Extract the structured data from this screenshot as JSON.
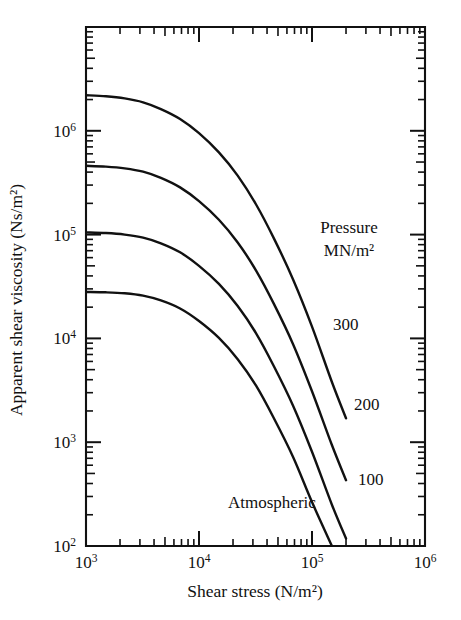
{
  "chart_data": {
    "type": "line",
    "title": "",
    "xlabel": "Shear stress (N/m²)",
    "ylabel": "Apparent shear viscosity (Ns/m²)",
    "xscale": "log",
    "yscale": "log",
    "xlim": [
      1000,
      1000000
    ],
    "ylim": [
      100,
      10000000
    ],
    "x_tick_labels": [
      "10³",
      "10⁴",
      "10⁵",
      "10⁶"
    ],
    "x_tick_values": [
      1000,
      10000,
      100000,
      1000000
    ],
    "y_tick_labels": [
      "10²",
      "10³",
      "10⁴",
      "10⁵",
      "10⁶"
    ],
    "y_tick_values": [
      100,
      1000,
      10000,
      100000,
      1000000
    ],
    "grid": false,
    "legend_position": "inside-right",
    "legend_title_line1": "Pressure",
    "legend_title_line2": "MN/m²",
    "annotations": [
      "Atmospheric"
    ],
    "series": [
      {
        "name": "300",
        "label": "300",
        "x": [
          1000,
          1500,
          2200,
          3200,
          4600,
          6800,
          10000,
          15000,
          22000,
          32000,
          46000,
          68000,
          100000,
          150000,
          200000
        ],
        "y": [
          2200000,
          2150000,
          2050000,
          1880000,
          1620000,
          1300000,
          950000,
          620000,
          370000,
          195000,
          92000,
          37000,
          13000,
          3800,
          1700
        ]
      },
      {
        "name": "200",
        "label": "200",
        "x": [
          1000,
          1500,
          2200,
          3200,
          4600,
          6800,
          10000,
          15000,
          22000,
          32000,
          46000,
          68000,
          100000,
          150000,
          200000
        ],
        "y": [
          460000,
          452000,
          435000,
          404000,
          352000,
          285000,
          210000,
          139000,
          84000,
          45000,
          21500,
          8800,
          3100,
          940,
          430
        ]
      },
      {
        "name": "100",
        "label": "100",
        "x": [
          1000,
          1500,
          2200,
          3200,
          4600,
          6800,
          10000,
          15000,
          22000,
          32000,
          46000,
          68000,
          100000,
          150000,
          200000
        ],
        "y": [
          105000,
          103500,
          100000,
          93500,
          82500,
          67500,
          50000,
          33500,
          20500,
          11200,
          5400,
          2250,
          810,
          250,
          118
        ]
      },
      {
        "name": "Atmospheric",
        "label": "Atmospheric",
        "x": [
          1000,
          1500,
          2200,
          3200,
          4600,
          6800,
          10000,
          15000,
          22000,
          32000,
          46000,
          68000,
          100000,
          150000,
          220000
        ],
        "y": [
          28000,
          27800,
          27200,
          25800,
          23200,
          19400,
          14700,
          10100,
          6300,
          3500,
          1700,
          720,
          265,
          83,
          100
        ]
      }
    ]
  },
  "axes": {
    "x_title": "Shear stress (N/m²)",
    "y_title": "Apparent shear viscosity (Ns/m²)"
  },
  "legend": {
    "title_line1": "Pressure",
    "title_line2": "MN/m²",
    "items": [
      "300",
      "200",
      "100"
    ],
    "atmospheric": "Atmospheric"
  },
  "ticks": {
    "x": [
      {
        "label": "10³",
        "base": "10",
        "exp": "3"
      },
      {
        "label": "10⁴",
        "base": "10",
        "exp": "4"
      },
      {
        "label": "10⁵",
        "base": "10",
        "exp": "5"
      },
      {
        "label": "10⁶",
        "base": "10",
        "exp": "6"
      }
    ],
    "y": [
      {
        "label": "10²",
        "base": "10",
        "exp": "2"
      },
      {
        "label": "10³",
        "base": "10",
        "exp": "3"
      },
      {
        "label": "10⁴",
        "base": "10",
        "exp": "4"
      },
      {
        "label": "10⁵",
        "base": "10",
        "exp": "5"
      },
      {
        "label": "10⁶",
        "base": "10",
        "exp": "6"
      }
    ]
  },
  "colors": {
    "ink": "#111111",
    "background": "#ffffff"
  }
}
